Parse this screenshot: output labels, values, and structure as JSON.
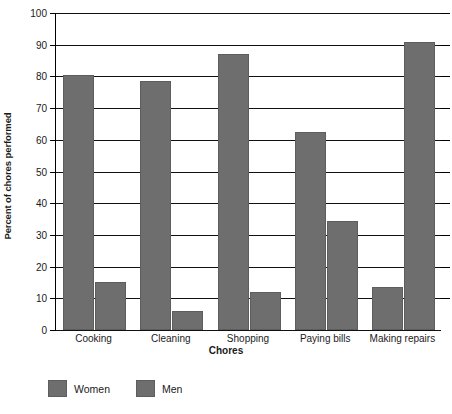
{
  "chart_data": {
    "type": "bar",
    "title": "",
    "xlabel": "Chores",
    "ylabel": "Percent of chores performed",
    "categories": [
      "Cooking",
      "Cleaning",
      "Shopping",
      "Paying bills",
      "Making repairs"
    ],
    "series": [
      {
        "name": "Women",
        "values": [
          80.5,
          78.5,
          87,
          62.5,
          13.5
        ]
      },
      {
        "name": "Men",
        "values": [
          15,
          6,
          12,
          34.5,
          91
        ]
      }
    ],
    "ylim": [
      0,
      100
    ],
    "ytick_step": 10,
    "yticks": [
      0,
      10,
      20,
      30,
      40,
      50,
      60,
      70,
      80,
      90,
      100
    ],
    "ytick_labels": [
      "0",
      "10",
      "20",
      "30",
      "40",
      "50",
      "60",
      "70",
      "80",
      "90",
      "100"
    ],
    "grid": true,
    "grid_axis": "y",
    "legend_position": "bottom-left",
    "bar_color": "#6e6e6e",
    "axis_color": "#111111",
    "background": "#ffffff"
  }
}
